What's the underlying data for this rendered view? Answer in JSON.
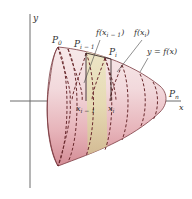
{
  "diagram": {
    "type": "solid-of-revolution-surface-area",
    "axes": {
      "x_label": "x",
      "y_label": "y"
    },
    "points": {
      "p0": {
        "main": "P",
        "sub": "0"
      },
      "pi_minus_1": {
        "main": "P",
        "sub": "i − 1"
      },
      "pi": {
        "main": "P",
        "sub": "i"
      },
      "pn": {
        "main": "P",
        "sub": "n"
      }
    },
    "callouts": {
      "f_xi_minus_1": "f(x",
      "f_xi_minus_1_sub": "i − 1",
      "f_xi_minus_1_close": ")",
      "f_xi": "f(x",
      "f_xi_sub": "i",
      "f_xi_close": ")",
      "curve": "y = f(x)"
    },
    "x_ticks": {
      "xi_minus_1": {
        "main": "x",
        "sub": "i − 1"
      },
      "xi": {
        "main": "x",
        "sub": "i"
      }
    },
    "colors": {
      "surface_light": "#f6e4e6",
      "surface_dark": "#d9979f",
      "band_highlight": "#e3d9a0",
      "outline": "#6a2a2e",
      "axis": "#555555"
    }
  }
}
